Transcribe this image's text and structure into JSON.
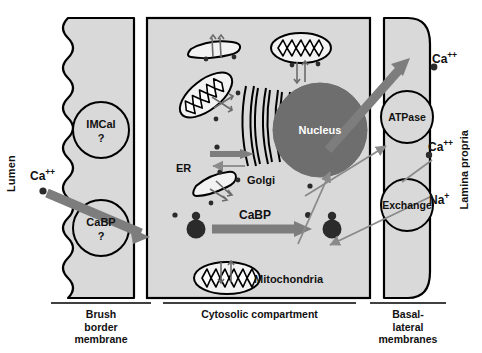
{
  "figure": {
    "type": "biological-cell-diagram"
  },
  "palette": {
    "panel_fill": "#d9d9d9",
    "panel_stroke": "#000000",
    "nucleus_fill": "#6e6e6e",
    "arrow_gray": "#7d7d7d",
    "thin_arrow": "#8a8a8a",
    "dot_dark": "#2b2b2b",
    "background": "#ffffff",
    "text": "#111111",
    "organelle_fill": "#f2f2f2"
  },
  "compartments": [
    {
      "id": "lumen",
      "label": "Lumen",
      "orientation": "vertical"
    },
    {
      "id": "brush-border",
      "label": "Brush\nborder\nmembrane",
      "orientation": "horizontal"
    },
    {
      "id": "cytosol",
      "label": "Cytosolic compartment",
      "orientation": "horizontal"
    },
    {
      "id": "basal-lateral",
      "label": "Basal-\nlateral\nmembranes",
      "orientation": "horizontal"
    },
    {
      "id": "lamina-propria",
      "label": "Lamina propria",
      "orientation": "vertical"
    }
  ],
  "labels": {
    "lumen": "Lumen",
    "lamina_propria": "Lamina propria",
    "brush_border": "Brush\nborder\nmembrane",
    "cytosolic_compartment": "Cytosolic compartment",
    "basal_lateral": "Basal-\nlateral\nmembranes",
    "nucleus": "Nucleus",
    "golgi": "Golgi",
    "er": "ER",
    "mitochondria": "Mitochondria",
    "cabp_arrow": "CaBP"
  },
  "transporters": [
    {
      "id": "imcal",
      "label": "IMCal",
      "sub": "?",
      "membrane": "brush-border"
    },
    {
      "id": "cabp",
      "label": "CaBP",
      "sub": "?",
      "membrane": "brush-border"
    },
    {
      "id": "atpase",
      "label": "ATPase",
      "sub": "",
      "membrane": "basal-lateral"
    },
    {
      "id": "exchange",
      "label": "Exchange",
      "sub": "",
      "membrane": "basal-lateral"
    }
  ],
  "ions": [
    {
      "id": "ca-lumen",
      "base": "Ca",
      "charge": "++",
      "side": "lumen"
    },
    {
      "id": "ca-out-top",
      "base": "Ca",
      "charge": "++",
      "side": "lamina-propria"
    },
    {
      "id": "ca-out-mid",
      "base": "Ca",
      "charge": "++",
      "side": "lamina-propria"
    },
    {
      "id": "na-out",
      "base": "Na",
      "charge": "+",
      "side": "lamina-propria"
    }
  ],
  "flows": [
    {
      "id": "uptake-arrow",
      "from": "lumen",
      "to": "cytosol",
      "style": "thick-gray",
      "label": ""
    },
    {
      "id": "cabp-transit",
      "from": "cytosol",
      "to": "cytosol",
      "style": "thick-gray",
      "label": "CaBP"
    },
    {
      "id": "atpase-efflux",
      "from": "cytosol",
      "to": "lamina-propria",
      "style": "thick-gray",
      "label": ""
    },
    {
      "id": "atpase-feed",
      "from": "cytosol",
      "to": "atpase",
      "style": "thin-gray",
      "label": ""
    },
    {
      "id": "exchange-ca-out",
      "from": "cytosol",
      "to": "lamina-propria",
      "style": "thin-gray",
      "label": ""
    },
    {
      "id": "exchange-na-in",
      "from": "lamina-propria",
      "to": "cytosol",
      "style": "thin-gray",
      "label": ""
    },
    {
      "id": "er-uptake",
      "from": "cytosol",
      "to": "er",
      "style": "thin-gray",
      "label": ""
    },
    {
      "id": "golgi-exchange",
      "from": "cytosol",
      "to": "golgi",
      "style": "thin-gray",
      "label": ""
    },
    {
      "id": "mito-top-left",
      "from": "cytosol",
      "to": "mitochondria",
      "style": "thin-gray",
      "label": ""
    },
    {
      "id": "mito-upper",
      "from": "cytosol",
      "to": "mitochondria",
      "style": "thin-gray",
      "label": ""
    },
    {
      "id": "mito-nuclear",
      "from": "cytosol",
      "to": "mitochondria",
      "style": "thin-gray",
      "label": ""
    },
    {
      "id": "mito-bottom",
      "from": "cytosol",
      "to": "mitochondria",
      "style": "thin-gray",
      "label": ""
    }
  ],
  "organelles": [
    {
      "id": "mito-top-left",
      "name": "mitochondrion",
      "shape": "rod"
    },
    {
      "id": "mito-upper-left",
      "name": "mitochondrion",
      "shape": "cristae-oval"
    },
    {
      "id": "mito-upper-mid",
      "name": "mitochondrion",
      "shape": "cristae-oval"
    },
    {
      "id": "er",
      "name": "endoplasmic-reticulum",
      "shape": "rod"
    },
    {
      "id": "golgi",
      "name": "golgi-apparatus",
      "shape": "stacked-cisternae"
    },
    {
      "id": "nucleus",
      "name": "nucleus",
      "shape": "filled-circle"
    },
    {
      "id": "mito-bottom",
      "name": "mitochondrion",
      "shape": "cristae-oval"
    },
    {
      "id": "vesicle-left",
      "name": "calcium-vesicle",
      "shape": "lollipop"
    },
    {
      "id": "vesicle-right",
      "name": "calcium-vesicle",
      "shape": "lollipop"
    }
  ]
}
